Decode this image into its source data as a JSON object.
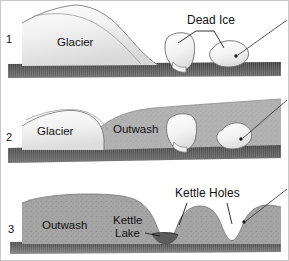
{
  "figure": {
    "background_color": "#ffffff",
    "border_color": "#c9c9c9",
    "width": 289,
    "height": 261
  },
  "palette": {
    "ice_fill_light": "#fbfbfb",
    "ice_fill_shade": "#e4e4e4",
    "ice_outline": "#6b6b6b",
    "glacier_light": "#f7f7f7",
    "glacier_mid": "#e9e9e9",
    "glacier_dark": "#d6d6d6",
    "outwash_fill": "#b0b0b0",
    "outwash_dark": "#9a9a9a",
    "bedrock_fill": "#4a4a4a",
    "bedrock_hatch": "#6e6e6e",
    "water_fill": "#5a5a5a",
    "label_color": "#111111",
    "leader_color": "#1a1a1a"
  },
  "panels": [
    {
      "number": "1",
      "labels": {
        "glacier": "Glacier",
        "dead_ice": "Dead Ice"
      },
      "description": "Glacier terminus with two detached dead ice blocks resting on bedrock",
      "callouts": [
        "Dead Ice"
      ],
      "ice_blocks": 2
    },
    {
      "number": "2",
      "labels": {
        "glacier": "Glacier",
        "outwash": "Outwash"
      },
      "description": "Retreating glacier, outwash sediment buries the dead ice blocks",
      "callouts": [],
      "ice_blocks": 2
    },
    {
      "number": "3",
      "labels": {
        "outwash": "Outwash",
        "kettle_lake": "Kettle Lake",
        "kettle_holes": "Kettle Holes"
      },
      "description": "Ice melts leaving depressions: a water filled kettle lake and dry kettle holes",
      "callouts": [
        "Kettle Lake",
        "Kettle Holes"
      ],
      "ice_blocks": 0
    }
  ],
  "text_items": {
    "panel1_number": "1",
    "panel1_glacier": "Glacier",
    "panel1_dead_ice": "Dead Ice",
    "panel2_number": "2",
    "panel2_glacier": "Glacier",
    "panel2_outwash": "Outwash",
    "panel3_number": "3",
    "panel3_outwash": "Outwash",
    "panel3_kettle_lake_line1": "Kettle",
    "panel3_kettle_lake_line2": "Lake",
    "panel3_kettle_holes": "Kettle Holes"
  }
}
